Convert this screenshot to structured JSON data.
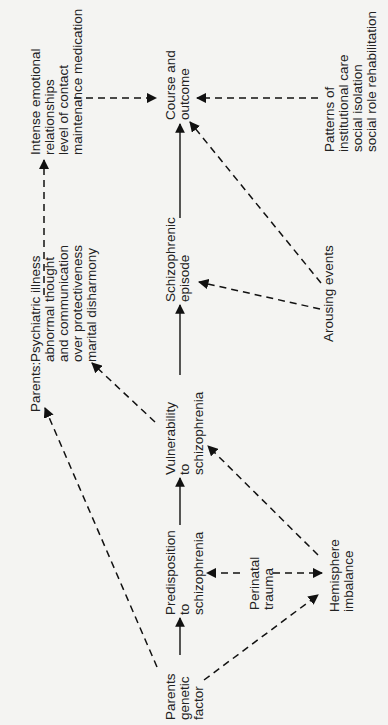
{
  "diagram": {
    "orientation": "rotated 90° counter-clockwise",
    "nodes": {
      "parents_genetic": [
        "Parents",
        "genetic",
        "factor"
      ],
      "predisposition": [
        "Predisposition",
        "to",
        "schizophrenia"
      ],
      "vulnerability": [
        "Vulnerability",
        "to",
        "schizophrenia"
      ],
      "episode": [
        "Schizophrenic",
        "episode"
      ],
      "course": [
        "Course and",
        "outcome"
      ],
      "parents_label": "Parents:",
      "parents_env": [
        "Psychiatric illness",
        "abnormal thought",
        "and communication",
        "over protectiveness",
        "marital disharmony"
      ],
      "emotional": [
        "Intense emotional",
        "relationships",
        "level of contact",
        "maintenance medication"
      ],
      "perinatal": [
        "Perinatal",
        "trauma"
      ],
      "hemisphere": [
        "Hemisphere",
        "imbalance"
      ],
      "arousing": [
        "Arousing events"
      ],
      "patterns": [
        "Patterns of",
        "institutional care",
        "social isolation",
        "social role rehabilitation"
      ]
    },
    "edges": [
      {
        "from": "Parents genetic factor",
        "to": "Predisposition to schizophrenia",
        "style": "solid"
      },
      {
        "from": "Predisposition to schizophrenia",
        "to": "Vulnerability to schizophrenia",
        "style": "solid"
      },
      {
        "from": "Vulnerability to schizophrenia",
        "to": "Schizophrenic episode",
        "style": "solid"
      },
      {
        "from": "Schizophrenic episode",
        "to": "Course and outcome",
        "style": "solid"
      },
      {
        "from": "Parents genetic factor",
        "to": "Parents: Psychiatric illness",
        "style": "dashed"
      },
      {
        "from": "Parents genetic factor",
        "to": "Hemisphere imbalance",
        "style": "dashed"
      },
      {
        "from": "Perinatal trauma",
        "to": "Predisposition to schizophrenia",
        "style": "dashed"
      },
      {
        "from": "Perinatal trauma",
        "to": "Hemisphere imbalance",
        "style": "dashed"
      },
      {
        "from": "Hemisphere imbalance",
        "to": "Vulnerability to schizophrenia",
        "style": "dashed"
      },
      {
        "from": "Vulnerability to schizophrenia",
        "to": "Parents: Psychiatric illness",
        "style": "dashed"
      },
      {
        "from": "Parents: Psychiatric illness",
        "to": "Intense emotional relationships",
        "style": "dashed"
      },
      {
        "from": "Intense emotional relationships",
        "to": "Course and outcome",
        "style": "dashed"
      },
      {
        "from": "Arousing events",
        "to": "Schizophrenic episode",
        "style": "dashed"
      },
      {
        "from": "Arousing events",
        "to": "Course and outcome",
        "style": "dashed"
      },
      {
        "from": "Patterns of institutional care",
        "to": "Course and outcome",
        "style": "dashed"
      }
    ]
  }
}
